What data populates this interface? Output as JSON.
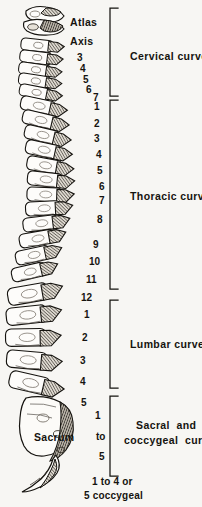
{
  "figure": {
    "title_alt": "Lateral view of the vertebral column showing the four spinal curves",
    "background_color": "#f7f6f3",
    "ink_color": "#15130f"
  },
  "named_labels": [
    {
      "id": "atlas",
      "text": "Atlas",
      "x": 70,
      "y": 17
    },
    {
      "id": "axis",
      "text": "Axis",
      "x": 70,
      "y": 36
    },
    {
      "id": "sacrum",
      "text": "Sacrum",
      "x": 34,
      "y": 432
    }
  ],
  "vertebra_numbers": {
    "cervical": [
      {
        "text": "3",
        "x": 77,
        "y": 53
      },
      {
        "text": "4",
        "x": 80,
        "y": 64
      },
      {
        "text": "5",
        "x": 83,
        "y": 75
      },
      {
        "text": "6",
        "x": 86,
        "y": 85
      },
      {
        "text": "7",
        "x": 93,
        "y": 93
      }
    ],
    "thoracic": [
      {
        "text": "1",
        "x": 94,
        "y": 102
      },
      {
        "text": "2",
        "x": 94,
        "y": 119
      },
      {
        "text": "3",
        "x": 94,
        "y": 134
      },
      {
        "text": "4",
        "x": 96,
        "y": 150
      },
      {
        "text": "5",
        "x": 97,
        "y": 166
      },
      {
        "text": "6",
        "x": 99,
        "y": 182
      },
      {
        "text": "7",
        "x": 99,
        "y": 196
      },
      {
        "text": "8",
        "x": 97,
        "y": 215
      },
      {
        "text": "9",
        "x": 93,
        "y": 240
      },
      {
        "text": "10",
        "x": 89,
        "y": 257
      },
      {
        "text": "11",
        "x": 86,
        "y": 275
      },
      {
        "text": "12",
        "x": 81,
        "y": 293
      }
    ],
    "lumbar": [
      {
        "text": "1",
        "x": 84,
        "y": 310
      },
      {
        "text": "2",
        "x": 82,
        "y": 333
      },
      {
        "text": "3",
        "x": 80,
        "y": 356
      },
      {
        "text": "4",
        "x": 80,
        "y": 377
      },
      {
        "text": "5",
        "x": 81,
        "y": 398
      }
    ],
    "sacral": [
      {
        "text": "1",
        "x": 95,
        "y": 411
      },
      {
        "text": "to",
        "x": 96,
        "y": 432
      },
      {
        "text": "5",
        "x": 99,
        "y": 452
      }
    ]
  },
  "curve_brackets": [
    {
      "id": "cervical",
      "label": "Cervical curve",
      "top": 8,
      "bottom": 96,
      "label_y": 51,
      "label_x": 130
    },
    {
      "id": "thoracic",
      "label": "Thoracic curve",
      "top": 100,
      "bottom": 289,
      "label_y": 191,
      "label_x": 130
    },
    {
      "id": "lumbar",
      "label": "Lumbar curve",
      "top": 300,
      "bottom": 388,
      "label_y": 339,
      "label_x": 130
    },
    {
      "id": "sacral_coccygeal",
      "label_line1": "Sacral  and",
      "label_line2": "coccygeal  curve",
      "top": 396,
      "bottom": 476,
      "label_y": 427,
      "label_x": 128
    }
  ],
  "bottom_caption": {
    "line1": "1 to 4 or",
    "line2": "5 coccygeal",
    "x": 126,
    "y": 481
  }
}
